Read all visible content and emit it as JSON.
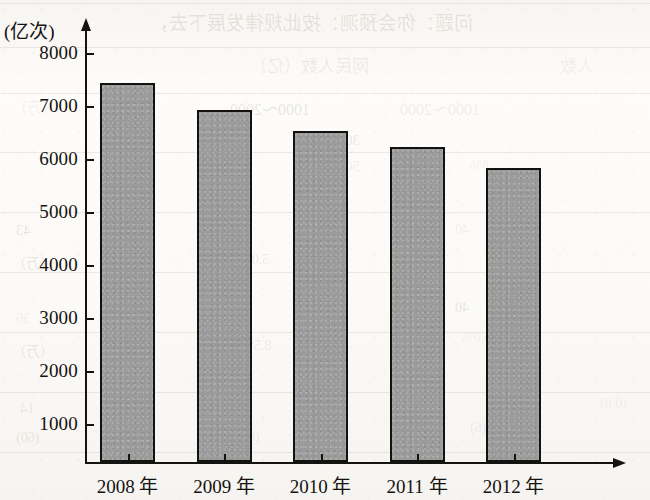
{
  "chart_data": {
    "type": "bar",
    "title": "",
    "subtitle": "",
    "xlabel": "",
    "ylabel": "(亿次)",
    "ylabel_note": "hundred million times",
    "categories": [
      "2008 年",
      "2009 年",
      "2010 年",
      "2011 年",
      "2012 年"
    ],
    "category_years": [
      2008,
      2009,
      2010,
      2011,
      2012
    ],
    "values": [
      7450,
      6950,
      6550,
      6250,
      5850
    ],
    "series": [
      {
        "name": "",
        "values": [
          7450,
          6950,
          6550,
          6250,
          5850
        ]
      }
    ],
    "ylim": [
      0,
      8450
    ],
    "y_axis_start_label": 1000,
    "y_tick_labels": [
      "1000",
      "2000",
      "3000",
      "4000",
      "5000",
      "6000",
      "7000",
      "8000"
    ],
    "y_tick_values": [
      1000,
      2000,
      3000,
      4000,
      5000,
      6000,
      7000,
      8000
    ],
    "y_tick_interval": 1000,
    "grid": false,
    "legend": false,
    "legend_position": "none",
    "bar_fill_color": "#9b9b9b",
    "bar_edge_color": "#141210",
    "axis_color": "#15130f",
    "axis_arrows": true,
    "annotations": []
  },
  "axes": {
    "y_title": "(亿次)",
    "ticks_y": [
      {
        "label": "8000",
        "value": 8000
      },
      {
        "label": "7000",
        "value": 7000
      },
      {
        "label": "6000",
        "value": 6000
      },
      {
        "label": "5000",
        "value": 5000
      },
      {
        "label": "4000",
        "value": 4000
      },
      {
        "label": "3000",
        "value": 3000
      },
      {
        "label": "2000",
        "value": 2000
      },
      {
        "label": "1000",
        "value": 1000
      }
    ],
    "ticks_x": [
      {
        "label": "2008 年"
      },
      {
        "label": "2009 年"
      },
      {
        "label": "2010 年"
      },
      {
        "label": "2011 年"
      },
      {
        "label": "2012 年"
      }
    ]
  },
  "bleed_through": {
    "note": "faint mirrored text showing through from the reverse side of the scanned page",
    "lines": [
      {
        "text": "问题：你会预测：按此规律发展下去，",
        "x": 150,
        "y": 8,
        "size": 19
      },
      {
        "text": "网民人数（亿）",
        "x": 250,
        "y": 52,
        "size": 17
      },
      {
        "text": "人数",
        "x": 560,
        "y": 52,
        "size": 17
      },
      {
        "text": "1000～2000",
        "x": 230,
        "y": 96,
        "size": 16
      },
      {
        "text": "1000～2000",
        "x": 400,
        "y": 96,
        "size": 16
      },
      {
        "text": "（万）",
        "x": 12,
        "y": 96,
        "size": 15
      },
      {
        "text": "3000",
        "x": 330,
        "y": 132,
        "size": 15
      },
      {
        "text": "5000",
        "x": 330,
        "y": 158,
        "size": 15
      },
      {
        "text": "8%",
        "x": 470,
        "y": 158,
        "size": 14
      },
      {
        "text": "43",
        "x": 16,
        "y": 222,
        "size": 15
      },
      {
        "text": "0.5",
        "x": 230,
        "y": 222,
        "size": 14
      },
      {
        "text": "40",
        "x": 455,
        "y": 222,
        "size": 14
      },
      {
        "text": "（万）",
        "x": 12,
        "y": 252,
        "size": 14
      },
      {
        "text": "5.0%",
        "x": 240,
        "y": 252,
        "size": 14
      },
      {
        "text": "36",
        "x": 16,
        "y": 310,
        "size": 15
      },
      {
        "text": "40",
        "x": 455,
        "y": 300,
        "size": 14
      },
      {
        "text": "8.5%",
        "x": 242,
        "y": 338,
        "size": 14
      },
      {
        "text": "6.0%",
        "x": 462,
        "y": 330,
        "size": 14
      },
      {
        "text": "（万）",
        "x": 12,
        "y": 340,
        "size": 14
      },
      {
        "text": "14",
        "x": 20,
        "y": 400,
        "size": 15
      },
      {
        "text": "(68)",
        "x": 236,
        "y": 430,
        "size": 14
      },
      {
        "text": "(60)",
        "x": 16,
        "y": 430,
        "size": 14
      },
      {
        "text": "(6)",
        "x": 470,
        "y": 420,
        "size": 14
      },
      {
        "text": "(0.8)",
        "x": 600,
        "y": 396,
        "size": 14
      }
    ]
  }
}
